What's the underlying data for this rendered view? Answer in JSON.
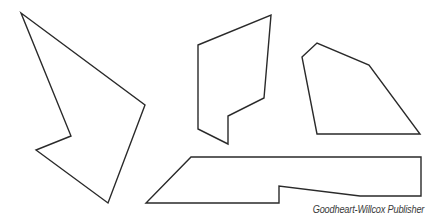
{
  "figure": {
    "stroke_color": "#2a2a2a",
    "stroke_width": 1.4,
    "fill_color": "#ffffff",
    "shapes": [
      {
        "name": "irregular-polygon-left",
        "points": "21,13 145,105 108,203 36,150 71,136"
      },
      {
        "name": "irregular-polygon-middle",
        "points": "198,45 271,15 264,98 228,116 228,144 198,129"
      },
      {
        "name": "irregular-polygon-right",
        "points": "302,57 317,43 369,65 420,134 317,134"
      },
      {
        "name": "irregular-polygon-bottom",
        "points": "191,157 421,157 421,196 360,196 279,186 279,203 146,203"
      }
    ]
  },
  "credit": {
    "text": "Goodheart-Willcox Publisher"
  }
}
